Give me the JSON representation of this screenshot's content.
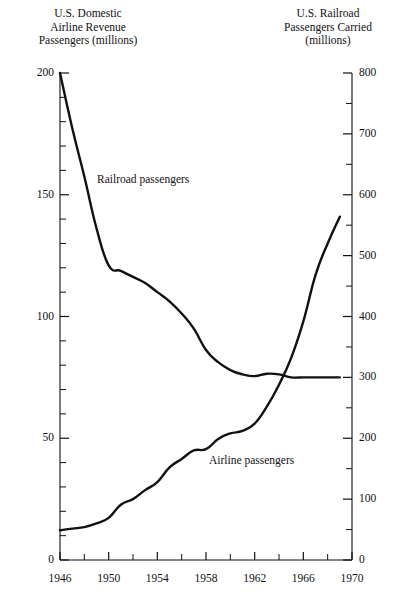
{
  "chart_data": {
    "type": "line",
    "title": "",
    "xlabel": "",
    "xlim": [
      1946,
      1970
    ],
    "x_ticks_major": [
      1946,
      1950,
      1954,
      1958,
      1962,
      1966,
      1970
    ],
    "x_ticks_minor": [
      1948,
      1952,
      1956,
      1960,
      1964,
      1968
    ],
    "grid": false,
    "legend_position": "inline-annotations",
    "axes": [
      {
        "side": "left",
        "label": "U.S. Domestic\nAirline Revenue\nPassengers (millions)",
        "ylim": [
          0,
          200
        ],
        "ticks_major": [
          0,
          50,
          100,
          150,
          200
        ],
        "tick_labels": [
          "0",
          "50",
          "100",
          "150",
          "200"
        ],
        "minor_tick_step": 10
      },
      {
        "side": "right",
        "label": "U.S. Railroad\nPassengers Carried\n(millions)",
        "ylim": [
          0,
          800
        ],
        "ticks_major": [
          0,
          100,
          200,
          300,
          400,
          500,
          600,
          700,
          800
        ],
        "tick_labels": [
          "0",
          "100",
          "200",
          "300",
          "400",
          "500",
          "600",
          "700",
          "800"
        ],
        "minor_tick_step": 50
      }
    ],
    "series": [
      {
        "name": "Railroad passengers",
        "axis": "right",
        "annotation": "Railroad passengers",
        "units": "millions",
        "x": [
          1946,
          1947,
          1948,
          1949,
          1950,
          1951,
          1952,
          1953,
          1954,
          1955,
          1956,
          1957,
          1958,
          1959,
          1960,
          1961,
          1962,
          1963,
          1964,
          1965,
          1966,
          1967,
          1968,
          1969
        ],
        "values": [
          800,
          710,
          630,
          545,
          484,
          475,
          465,
          455,
          440,
          425,
          405,
          380,
          345,
          325,
          312,
          305,
          302,
          306,
          305,
          300,
          300,
          300,
          300,
          300
        ]
      },
      {
        "name": "Airline passengers",
        "axis": "left",
        "annotation": "Airline passengers",
        "units": "millions",
        "x": [
          1946,
          1947,
          1948,
          1949,
          1950,
          1951,
          1952,
          1953,
          1954,
          1955,
          1956,
          1957,
          1958,
          1959,
          1960,
          1961,
          1962,
          1963,
          1964,
          1965,
          1966,
          1967,
          1968,
          1969
        ],
        "values": [
          12.2,
          12.9,
          13.5,
          15.0,
          17.3,
          22.7,
          25.0,
          28.7,
          32.0,
          38.0,
          41.5,
          45.0,
          45.5,
          49.7,
          52.0,
          53.0,
          56.0,
          63.0,
          72.0,
          83.0,
          98.0,
          117.0,
          130.0,
          141.0
        ]
      }
    ]
  },
  "annotations": {
    "railroad": "Railroad passengers",
    "airline": "Airline passengers"
  },
  "left_axis": {
    "title": "U.S. Domestic\nAirline Revenue\nPassengers (millions)",
    "tick_labels": [
      "200",
      "150",
      "100",
      "50",
      "0"
    ]
  },
  "right_axis": {
    "title": "U.S. Railroad\nPassengers Carried\n(millions)",
    "tick_labels": [
      "800",
      "700",
      "600",
      "500",
      "400",
      "300",
      "200",
      "100",
      "0"
    ]
  },
  "x_axis": {
    "tick_labels": [
      "1946",
      "1950",
      "1954",
      "1958",
      "1962",
      "1966",
      "1970"
    ]
  },
  "colors": {
    "background": "#ffffff",
    "ink": "#000000",
    "line": "#111111"
  }
}
